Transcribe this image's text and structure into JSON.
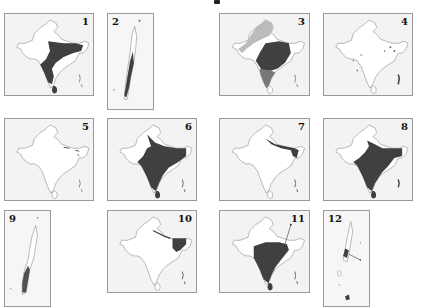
{
  "figure": {
    "colors": {
      "dark_fill": "#404040",
      "medium_fill": "#777777",
      "light_fill": "#bbbbbb",
      "sea": "#f3f3f3",
      "land": "#ffffff",
      "outline": "#8a8a8a"
    },
    "panels": [
      {
        "id": 1,
        "label": "1",
        "type": "mainland",
        "x": 4,
        "y": 13,
        "w": 90,
        "h": 83,
        "label_pos": "right",
        "fill": "south-peninsula-and-east"
      },
      {
        "id": 2,
        "label": "2",
        "type": "islands",
        "x": 107,
        "y": 13,
        "w": 47,
        "h": 97,
        "label_pos": "left",
        "fill": "islands-dark"
      },
      {
        "id": 3,
        "label": "3",
        "type": "mainland",
        "x": 219,
        "y": 13,
        "w": 91,
        "h": 83,
        "label_pos": "right",
        "fill": "central-dark-south-medium-nw-light"
      },
      {
        "id": 4,
        "label": "4",
        "type": "mainland",
        "x": 323,
        "y": 13,
        "w": 90,
        "h": 83,
        "label_pos": "right",
        "fill": "scattered-points"
      },
      {
        "id": 5,
        "label": "5",
        "type": "mainland",
        "x": 4,
        "y": 118,
        "w": 90,
        "h": 83,
        "label_pos": "right",
        "fill": "northeast-spots"
      },
      {
        "id": 6,
        "label": "6",
        "type": "mainland",
        "x": 107,
        "y": 118,
        "w": 90,
        "h": 83,
        "label_pos": "right",
        "fill": "most-of-india"
      },
      {
        "id": 7,
        "label": "7",
        "type": "mainland",
        "x": 219,
        "y": 118,
        "w": 91,
        "h": 83,
        "label_pos": "right",
        "fill": "himalaya-northeast"
      },
      {
        "id": 8,
        "label": "8",
        "type": "mainland",
        "x": 323,
        "y": 118,
        "w": 90,
        "h": 83,
        "label_pos": "right",
        "fill": "most-of-india"
      },
      {
        "id": 9,
        "label": "9",
        "type": "islands",
        "x": 4,
        "y": 210,
        "w": 47,
        "h": 97,
        "label_pos": "left",
        "fill": "islands-south-dark"
      },
      {
        "id": 10,
        "label": "10",
        "type": "mainland",
        "x": 107,
        "y": 210,
        "w": 90,
        "h": 83,
        "label_pos": "right",
        "fill": "northeast-dark"
      },
      {
        "id": 11,
        "label": "11",
        "type": "mainland",
        "x": 219,
        "y": 210,
        "w": 91,
        "h": 83,
        "label_pos": "right",
        "fill": "peninsula-dark"
      },
      {
        "id": 12,
        "label": "12",
        "type": "islands",
        "x": 323,
        "y": 210,
        "w": 47,
        "h": 97,
        "label_pos": "left",
        "fill": "islands-spots"
      }
    ]
  }
}
